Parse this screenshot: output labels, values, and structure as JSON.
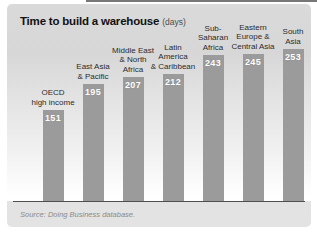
{
  "figure": {
    "title": "Time to build a warehouse",
    "title_unit": "(days)",
    "source_note": "Source: Doing Business database."
  },
  "chart_data": {
    "type": "bar",
    "orientation": "vertical",
    "title": "Time to build a warehouse",
    "unit_label": "(days)",
    "categories": [
      "OECD high income",
      "East Asia & Pacific",
      "Middle East & North Africa",
      "Latin America & Caribbean",
      "Sub-Saharan Africa",
      "Eastern Europe & Central Asia",
      "South Asia"
    ],
    "category_lines": [
      [
        "OECD",
        "high income"
      ],
      [
        "East Asia",
        "& Pacific"
      ],
      [
        "Middle East",
        "& North",
        "Africa"
      ],
      [
        "Latin",
        "America",
        "& Caribbean"
      ],
      [
        "Sub-",
        "Saharan",
        "Africa"
      ],
      [
        "Eastern",
        "Europe &",
        "Central Asia"
      ],
      [
        "South",
        "Asia"
      ]
    ],
    "values": [
      151,
      195,
      207,
      212,
      243,
      245,
      253
    ],
    "value_labels_shown": true,
    "ylim": [
      0,
      260
    ],
    "grid": false,
    "legend": false,
    "axis_ticks_shown": false,
    "bar_color": "#9b9b9b",
    "value_label_color": "#ffffff",
    "baseline_color": "#4f4f4f",
    "background_top_color": "#dadada",
    "background_bottom_color": "#ffffff"
  }
}
